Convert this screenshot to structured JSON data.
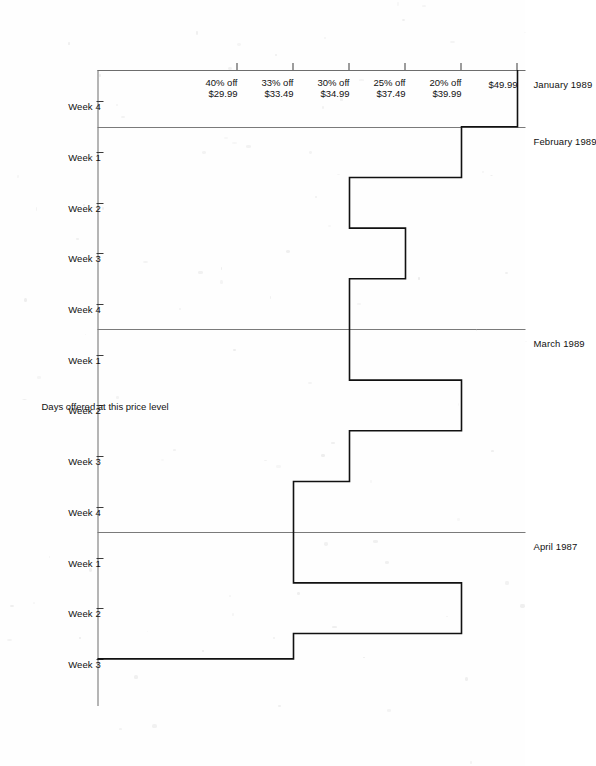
{
  "chart_data": {
    "type": "line",
    "subtype": "step",
    "title": "",
    "xlabel": "",
    "ylabel": "Days offered at this price level",
    "orientation": "rotated-90-ccw",
    "grid": false,
    "legend": null,
    "y_categories": [
      "$49.99",
      "20% off\n$39.99",
      "25% off\n$37.49",
      "30% off\n$34.99",
      "33% off\n$33.49",
      "40% off\n$29.99"
    ],
    "price_levels": [
      {
        "index": 0,
        "discount": "",
        "price": "$49.99",
        "label_line1": "$49.99",
        "label_line2": ""
      },
      {
        "index": 1,
        "discount": "20% off",
        "price": "$39.99",
        "label_line1": "20% off",
        "label_line2": "$39.99"
      },
      {
        "index": 2,
        "discount": "25% off",
        "price": "$37.49",
        "label_line1": "25% off",
        "label_line2": "$37.49"
      },
      {
        "index": 3,
        "discount": "30% off",
        "price": "$34.99",
        "label_line1": "30% off",
        "label_line2": "$34.99"
      },
      {
        "index": 4,
        "discount": "33% off",
        "price": "$33.49",
        "label_line1": "33% off",
        "label_line2": "$33.49"
      },
      {
        "index": 5,
        "discount": "40% off",
        "price": "$29.99",
        "label_line1": "40% off",
        "label_line2": "$29.99"
      }
    ],
    "months": [
      {
        "label": "January 1989",
        "start_week_index": 0,
        "end_week_index": 1
      },
      {
        "label": "February 1989",
        "start_week_index": 1,
        "end_week_index": 5
      },
      {
        "label": "March 1989",
        "start_week_index": 5,
        "end_week_index": 9
      },
      {
        "label": "April 1987",
        "start_week_index": 9,
        "end_week_index": 12
      }
    ],
    "x": [
      "Week 4",
      "Week 1",
      "Week 2",
      "Week 3",
      "Week 4",
      "Week 1",
      "Week 2",
      "Week 3",
      "Week 4",
      "Week 1",
      "Week 2",
      "Week 3"
    ],
    "series": [
      {
        "name": "Price level over time",
        "price_level_index": [
          0,
          1,
          3,
          2,
          3,
          3,
          1,
          3,
          4,
          4,
          1,
          4
        ],
        "values": [
          49.99,
          39.99,
          34.99,
          37.49,
          34.99,
          34.99,
          39.99,
          34.99,
          33.49,
          33.49,
          39.99,
          33.49
        ]
      }
    ],
    "x_tick_labels": [
      "Week 4",
      "Week 1",
      "Week 2",
      "Week 3",
      "Week 4",
      "Week 1",
      "Week 2",
      "Week 3",
      "Week 4",
      "Week 1",
      "Week 2",
      "Week 3"
    ]
  },
  "axis": {
    "value_axis_title": "Days offered at this price level"
  }
}
